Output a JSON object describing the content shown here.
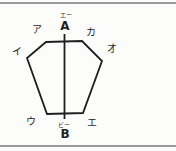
{
  "diagram": {
    "description_type": "geometry-figure",
    "labels": {
      "a_furigana": "エー",
      "a": "A",
      "b_furigana": "ビー",
      "b": "B",
      "top_left": "ア",
      "top_right": "カ",
      "left": "イ",
      "right": "オ",
      "bottom_left": "ウ",
      "bottom_right": "エ"
    },
    "colors": {
      "shape_stroke": "#1f1f1f",
      "rule_line": "#9a9a9a",
      "background": "#fcfcfb",
      "text": "#1f1f1f"
    }
  }
}
